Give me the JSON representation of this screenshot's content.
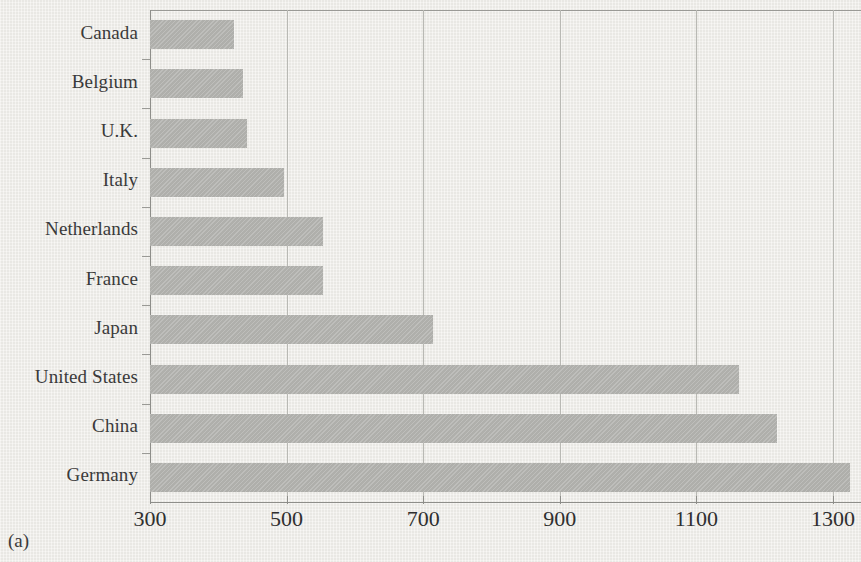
{
  "caption": "(a)",
  "chart_data": {
    "type": "bar",
    "orientation": "horizontal",
    "title": "",
    "subtitle": "",
    "xlabel": "",
    "ylabel": "",
    "categories": [
      "Canada",
      "Belgium",
      "U.K.",
      "Italy",
      "Netherlands",
      "France",
      "Japan",
      "United States",
      "China",
      "Germany"
    ],
    "values": [
      423,
      436,
      442,
      496,
      553,
      553,
      714,
      1162,
      1218,
      1325
    ],
    "xlim": [
      300,
      1353
    ],
    "xticks": [
      300,
      500,
      700,
      900,
      1100,
      1300
    ],
    "xtick_labels": [
      "300",
      "500",
      "700",
      "900",
      "1100",
      "1300"
    ],
    "grid": "vertical",
    "legend": "none",
    "bar_color": "#b2b2ae",
    "background_color": "#efeeea",
    "axis_color": "#8e8e8a",
    "gridline_color": "#b9b9b4",
    "text_color": "#3a3a3a"
  }
}
